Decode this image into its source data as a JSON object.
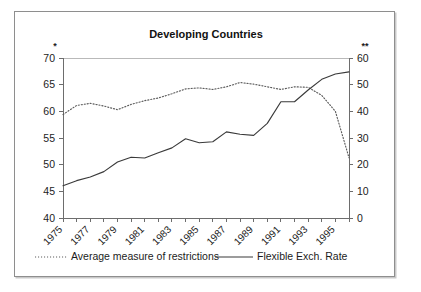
{
  "figure": {
    "title": "Developing Countries",
    "left_axis_marker": "*",
    "right_axis_marker": "**"
  },
  "legend": {
    "entries": [
      {
        "label": "Average measure of restrictions",
        "style": "dotted",
        "axis": "left"
      },
      {
        "label": "Flexible Exch. Rate",
        "style": "solid",
        "axis": "right"
      }
    ]
  },
  "chart_data": {
    "type": "line",
    "title": "Developing Countries",
    "xlabel": "",
    "ylabel": "",
    "grid": false,
    "legend_position": "bottom",
    "x": [
      1975,
      1976,
      1977,
      1978,
      1979,
      1980,
      1981,
      1982,
      1983,
      1984,
      1985,
      1986,
      1987,
      1988,
      1989,
      1990,
      1991,
      1992,
      1993,
      1994,
      1995,
      1996
    ],
    "xtick_labels": [
      "1975",
      "1977",
      "1979",
      "1981",
      "1983",
      "1985",
      "1987",
      "1989",
      "1991",
      "1993",
      "1995"
    ],
    "xtick_values": [
      1975,
      1977,
      1979,
      1981,
      1983,
      1985,
      1987,
      1989,
      1991,
      1993,
      1995
    ],
    "left_axis": {
      "ylim": [
        40,
        70
      ],
      "ticks": [
        40,
        45,
        50,
        55,
        60,
        65,
        70
      ],
      "marker": "*"
    },
    "right_axis": {
      "ylim": [
        0,
        60
      ],
      "ticks": [
        0,
        10,
        20,
        30,
        40,
        50,
        60
      ],
      "marker": "**"
    },
    "series": [
      {
        "name": "Average measure of restrictions",
        "style": "dotted",
        "axis": "left",
        "values": [
          59.4,
          61.1,
          61.5,
          61.0,
          60.3,
          61.3,
          62.0,
          62.5,
          63.3,
          64.2,
          64.4,
          64.1,
          64.6,
          65.4,
          65.1,
          64.6,
          64.1,
          64.6,
          64.5,
          63.0,
          60.0,
          51.3
        ]
      },
      {
        "name": "Flexible Exch. Rate",
        "style": "solid",
        "axis": "right",
        "values": [
          12.1,
          14.0,
          15.4,
          17.4,
          21.0,
          22.8,
          22.5,
          24.5,
          26.3,
          29.7,
          28.2,
          28.6,
          32.3,
          31.4,
          31.0,
          35.5,
          43.6,
          43.6,
          48.0,
          52.0,
          54.0,
          54.8
        ]
      }
    ]
  }
}
